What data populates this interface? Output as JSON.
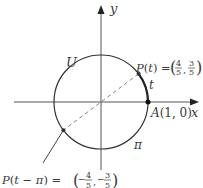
{
  "diagram": {
    "axes": {
      "x_label": "x",
      "y_label": "y"
    },
    "circle": {
      "label": "U",
      "center": [
        0,
        0
      ],
      "radius": 1
    },
    "points": [
      {
        "name": "A",
        "label": "A(1, 0)",
        "coords": [
          1,
          0
        ]
      },
      {
        "name": "P(t)",
        "label_prefix": "P(t) = ",
        "x_num": "4",
        "x_den": "5",
        "y_num": "3",
        "y_den": "5",
        "coords": [
          0.8,
          0.6
        ]
      },
      {
        "name": "P(t − π)",
        "label_prefix": "P(t − π) = ",
        "x_num": "4",
        "x_den": "5",
        "y_num": "3",
        "y_den": "5",
        "x_sign": "−",
        "y_sign": "−",
        "coords": [
          -0.8,
          -0.6
        ]
      }
    ],
    "arc_labels": {
      "short_arc": "t",
      "long_arc": "π"
    }
  }
}
